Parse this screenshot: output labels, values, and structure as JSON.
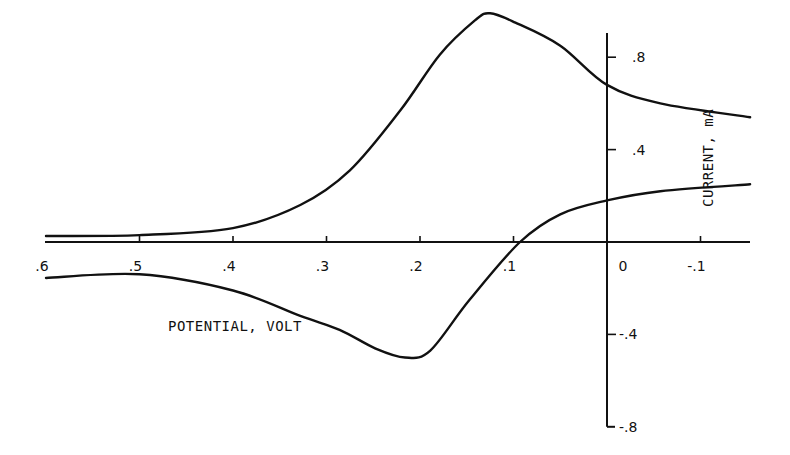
{
  "chart_data": {
    "type": "line",
    "title": "",
    "xlabel": "POTENTIAL, VOLT",
    "ylabel": "CURRENT, mA",
    "x_reversed": true,
    "xlim": [
      0.6,
      -0.15
    ],
    "ylim": [
      -0.8,
      0.9
    ],
    "grid": false,
    "legend": null,
    "x_ticks": [
      0.6,
      0.5,
      0.4,
      0.3,
      0.2,
      0.1,
      0,
      -0.1
    ],
    "x_tick_labels": [
      ".6",
      ".5",
      ".4",
      ".3",
      ".2",
      ".1",
      "0",
      "-.1"
    ],
    "y_ticks": [
      0.8,
      0.4,
      0,
      -0.4,
      -0.8
    ],
    "y_tick_labels": [
      ".8",
      ".4",
      "",
      "-.4",
      "-.8"
    ],
    "series": [
      {
        "name": "forward scan (upper branch)",
        "x": [
          0.6,
          0.5,
          0.4,
          0.328,
          0.275,
          0.221,
          0.179,
          0.141,
          0.125,
          0.098,
          0.05,
          0.0,
          -0.057,
          -0.153
        ],
        "y": [
          0.026,
          0.03,
          0.06,
          0.16,
          0.31,
          0.57,
          0.81,
          0.96,
          0.99,
          0.95,
          0.85,
          0.68,
          0.6,
          0.54
        ]
      },
      {
        "name": "reverse scan (lower branch)",
        "x": [
          0.6,
          0.5,
          0.4,
          0.328,
          0.286,
          0.248,
          0.216,
          0.189,
          0.147,
          0.093,
          0.05,
          0.0,
          -0.057,
          -0.153
        ],
        "y": [
          -0.156,
          -0.14,
          -0.21,
          -0.32,
          -0.38,
          -0.46,
          -0.5,
          -0.47,
          -0.25,
          0.0,
          0.12,
          0.18,
          0.22,
          0.25
        ]
      }
    ],
    "annotations": []
  },
  "labels": {
    "x_axis": "POTENTIAL, VOLT",
    "y_axis": "CURRENT, mA"
  }
}
